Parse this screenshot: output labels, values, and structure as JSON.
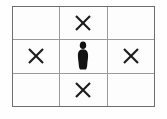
{
  "figure": {
    "grid": {
      "rows": 3,
      "columns": 3,
      "border_color": "#6e6e6e",
      "line_color": "#9a9a9a",
      "cell_background": "#fdfdfd"
    },
    "mark_colors": {
      "x": "#1c1c1c",
      "person": "#121212"
    },
    "cells": [
      {
        "row": 1,
        "col": 1,
        "mark": "empty",
        "label": ""
      },
      {
        "row": 1,
        "col": 2,
        "mark": "x",
        "label": "X"
      },
      {
        "row": 1,
        "col": 3,
        "mark": "empty",
        "label": ""
      },
      {
        "row": 2,
        "col": 1,
        "mark": "x",
        "label": "X"
      },
      {
        "row": 2,
        "col": 2,
        "mark": "person",
        "label": "person"
      },
      {
        "row": 2,
        "col": 3,
        "mark": "x",
        "label": "X"
      },
      {
        "row": 3,
        "col": 1,
        "mark": "empty",
        "label": ""
      },
      {
        "row": 3,
        "col": 2,
        "mark": "x",
        "label": "X"
      },
      {
        "row": 3,
        "col": 3,
        "mark": "empty",
        "label": ""
      }
    ]
  }
}
